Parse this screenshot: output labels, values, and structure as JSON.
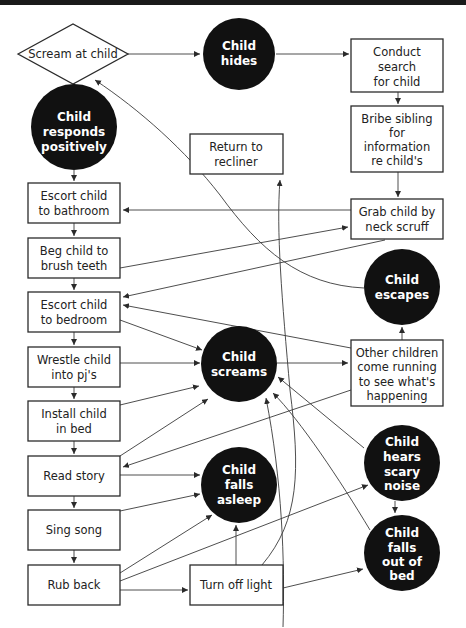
{
  "diagram": {
    "type": "flowchart",
    "colors": {
      "box_stroke": "#2b2b2b",
      "circle_fill": "#111111",
      "circle_text": "#ffffff",
      "box_text": "#222222",
      "edge": "#3a3a3a",
      "top_bar": "#1a1a1a"
    },
    "nodes": {
      "scream": {
        "shape": "diamond",
        "lines": [
          "Scream at child"
        ]
      },
      "hides": {
        "shape": "circle",
        "lines": [
          "Child",
          "hides"
        ]
      },
      "search": {
        "shape": "box",
        "lines": [
          "Conduct",
          "search",
          "for child"
        ]
      },
      "responds": {
        "shape": "circle",
        "lines": [
          "Child",
          "responds",
          "positively"
        ]
      },
      "bribe": {
        "shape": "box",
        "lines": [
          "Bribe sibling",
          "for",
          "information",
          "re child's",
          "whereabouts"
        ]
      },
      "recliner": {
        "shape": "box",
        "lines": [
          "Return to",
          "recliner"
        ]
      },
      "bathroom": {
        "shape": "box",
        "lines": [
          "Escort child",
          "to bathroom"
        ]
      },
      "grab": {
        "shape": "box",
        "lines": [
          "Grab child by",
          "neck scruff"
        ]
      },
      "teeth": {
        "shape": "box",
        "lines": [
          "Beg child to",
          "brush teeth"
        ]
      },
      "escapes": {
        "shape": "circle",
        "lines": [
          "Child",
          "escapes"
        ]
      },
      "bedroom": {
        "shape": "box",
        "lines": [
          "Escort child",
          "to bedroom"
        ]
      },
      "screams": {
        "shape": "circle",
        "lines": [
          "Child",
          "screams"
        ]
      },
      "others": {
        "shape": "box",
        "lines": [
          "Other children",
          "come running",
          "to see what's",
          "happening"
        ]
      },
      "pjs": {
        "shape": "box",
        "lines": [
          "Wrestle child",
          "into pj's"
        ]
      },
      "bed": {
        "shape": "box",
        "lines": [
          "Install child",
          "in bed"
        ]
      },
      "story": {
        "shape": "box",
        "lines": [
          "Read story"
        ]
      },
      "noise": {
        "shape": "circle",
        "lines": [
          "Child",
          "hears",
          "scary",
          "noise"
        ]
      },
      "asleep": {
        "shape": "circle",
        "lines": [
          "Child",
          "falls",
          "asleep"
        ]
      },
      "song": {
        "shape": "box",
        "lines": [
          "Sing song"
        ]
      },
      "fallsout": {
        "shape": "circle",
        "lines": [
          "Child",
          "falls",
          "out of",
          "bed"
        ]
      },
      "rub": {
        "shape": "box",
        "lines": [
          "Rub back"
        ]
      },
      "light": {
        "shape": "box",
        "lines": [
          "Turn off light"
        ]
      }
    },
    "edges": [
      [
        "scream",
        "hides"
      ],
      [
        "scream",
        "responds"
      ],
      [
        "hides",
        "search"
      ],
      [
        "search",
        "bribe"
      ],
      [
        "bribe",
        "grab"
      ],
      [
        "responds",
        "bathroom"
      ],
      [
        "grab",
        "bathroom"
      ],
      [
        "teeth",
        "grab"
      ],
      [
        "grab",
        "bedroom"
      ],
      [
        "bathroom",
        "teeth"
      ],
      [
        "teeth",
        "bedroom"
      ],
      [
        "escapes",
        "scream"
      ],
      [
        "others",
        "bedroom"
      ],
      [
        "bedroom",
        "screams"
      ],
      [
        "bedroom",
        "pjs"
      ],
      [
        "pjs",
        "screams"
      ],
      [
        "screams",
        "others"
      ],
      [
        "others",
        "escapes"
      ],
      [
        "others",
        "story"
      ],
      [
        "pjs",
        "bed"
      ],
      [
        "bed",
        "screams"
      ],
      [
        "bed",
        "story"
      ],
      [
        "story",
        "screams"
      ],
      [
        "story",
        "asleep"
      ],
      [
        "story",
        "song"
      ],
      [
        "song",
        "asleep"
      ],
      [
        "song",
        "rub"
      ],
      [
        "rub",
        "asleep"
      ],
      [
        "rub",
        "noise"
      ],
      [
        "rub",
        "light"
      ],
      [
        "light",
        "asleep"
      ],
      [
        "light",
        "recliner"
      ],
      [
        "light",
        "fallsout"
      ],
      [
        "noise",
        "screams"
      ],
      [
        "noise",
        "fallsout"
      ],
      [
        "fallsout",
        "screams"
      ],
      [
        "asleep",
        "screams"
      ]
    ]
  }
}
